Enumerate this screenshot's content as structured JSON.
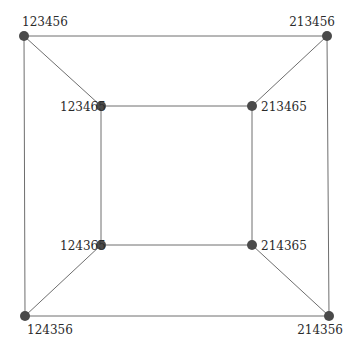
{
  "diagram": {
    "type": "graph",
    "nodes": [
      {
        "id": "n0",
        "label": "123456",
        "x": 24,
        "y": 36,
        "lx": 22,
        "ly": 26,
        "anchor": "start"
      },
      {
        "id": "n1",
        "label": "213456",
        "x": 327,
        "y": 36,
        "lx": 335,
        "ly": 26,
        "anchor": "end"
      },
      {
        "id": "n2",
        "label": "123465",
        "x": 101,
        "y": 106,
        "lx": 60,
        "ly": 111,
        "anchor": "start"
      },
      {
        "id": "n3",
        "label": "213465",
        "x": 252,
        "y": 106,
        "lx": 261,
        "ly": 111,
        "anchor": "start"
      },
      {
        "id": "n4",
        "label": "124365",
        "x": 101,
        "y": 245,
        "lx": 60,
        "ly": 250,
        "anchor": "start"
      },
      {
        "id": "n5",
        "label": "214365",
        "x": 252,
        "y": 245,
        "lx": 261,
        "ly": 250,
        "anchor": "start"
      },
      {
        "id": "n6",
        "label": "124356",
        "x": 25,
        "y": 316,
        "lx": 27,
        "ly": 334,
        "anchor": "start"
      },
      {
        "id": "n7",
        "label": "214356",
        "x": 329,
        "y": 316,
        "lx": 343,
        "ly": 334,
        "anchor": "end"
      }
    ],
    "edges": [
      [
        "n0",
        "n1"
      ],
      [
        "n0",
        "n6"
      ],
      [
        "n1",
        "n7"
      ],
      [
        "n6",
        "n7"
      ],
      [
        "n2",
        "n3"
      ],
      [
        "n2",
        "n4"
      ],
      [
        "n3",
        "n5"
      ],
      [
        "n4",
        "n5"
      ],
      [
        "n0",
        "n2"
      ],
      [
        "n1",
        "n3"
      ],
      [
        "n6",
        "n4"
      ],
      [
        "n7",
        "n5"
      ]
    ]
  }
}
